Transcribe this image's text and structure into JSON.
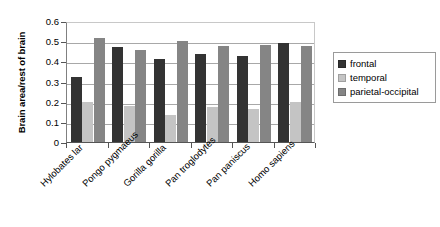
{
  "chart_data": {
    "type": "bar",
    "title": "",
    "xlabel": "",
    "ylabel": "Brain area/rest of brain",
    "ylim": [
      0,
      0.6
    ],
    "ytick_labels": [
      "0.6",
      "0.5",
      "0.4",
      "0.3",
      "0.2",
      "0.1",
      "0"
    ],
    "ytick_values": [
      0.6,
      0.5,
      0.4,
      0.3,
      0.2,
      0.1,
      0
    ],
    "grid": true,
    "legend_position": "right",
    "categories": [
      "Hylobates lar",
      "Pongo pygmaeus",
      "Gorilla gorilla",
      "Pan troglodytes",
      "Pan paniscus",
      "Homo sapiens"
    ],
    "series": [
      {
        "name": "frontal",
        "color": "#333333",
        "values": [
          0.32,
          0.47,
          0.41,
          0.435,
          0.425,
          0.49
        ]
      },
      {
        "name": "temporal",
        "color": "#c4c4c4",
        "values": [
          0.198,
          0.177,
          0.135,
          0.173,
          0.165,
          0.198
        ]
      },
      {
        "name": "parietal-occipital",
        "color": "#858585",
        "values": [
          0.517,
          0.455,
          0.5,
          0.475,
          0.48,
          0.475
        ]
      }
    ]
  },
  "legend": {
    "items": [
      {
        "label": "frontal",
        "color": "#333333"
      },
      {
        "label": "temporal",
        "color": "#c4c4c4"
      },
      {
        "label": "parietal-occipital",
        "color": "#858585"
      }
    ]
  },
  "axis": {
    "y_title": "Brain area/rest of brain"
  }
}
